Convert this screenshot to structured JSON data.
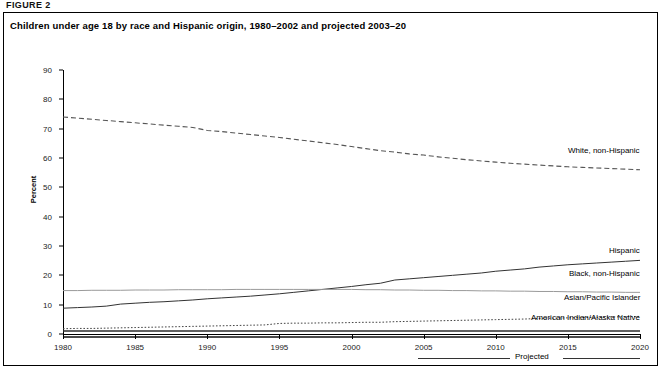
{
  "figure": {
    "label": "FIGURE 2",
    "title": "Children under age 18 by race and Hispanic origin, 1980–2002 and projected 2003–20",
    "projected_note": "Projected"
  },
  "chart_data": {
    "type": "line",
    "title": "Children under age 18 by race and Hispanic origin, 1980–2002 and projected 2003–20",
    "xlabel": "",
    "ylabel": "Percent",
    "xlim": [
      1980,
      2020
    ],
    "ylim": [
      0,
      90
    ],
    "ytick_labels": [
      "0",
      "10",
      "20",
      "30",
      "40",
      "50",
      "60",
      "70",
      "80",
      "90"
    ],
    "yticks": [
      0,
      10,
      20,
      30,
      40,
      50,
      60,
      70,
      80,
      90
    ],
    "xtick_labels": [
      "1980",
      "1985",
      "1990",
      "1995",
      "2000",
      "2005",
      "2010",
      "2015",
      "2020"
    ],
    "xticks": [
      1980,
      1985,
      1990,
      1995,
      2000,
      2005,
      2010,
      2015,
      2020
    ],
    "grid": false,
    "legend_position": "inline-right",
    "projected_start": 2003,
    "x": [
      1980,
      1981,
      1982,
      1983,
      1984,
      1985,
      1986,
      1987,
      1988,
      1989,
      1990,
      1991,
      1992,
      1993,
      1994,
      1995,
      1996,
      1997,
      1998,
      1999,
      2000,
      2001,
      2002,
      2003,
      2004,
      2005,
      2006,
      2007,
      2008,
      2009,
      2010,
      2011,
      2012,
      2013,
      2014,
      2015,
      2016,
      2017,
      2018,
      2019,
      2020
    ],
    "series": [
      {
        "name": "White, non-Hispanic",
        "style": "dashed",
        "color": "#555555",
        "label_x": 2010,
        "label_y": 62,
        "values": [
          74.0,
          73.6,
          73.2,
          72.8,
          72.4,
          72.0,
          71.6,
          71.2,
          70.8,
          70.4,
          69.4,
          69.0,
          68.5,
          68.0,
          67.5,
          67.0,
          66.4,
          65.8,
          65.2,
          64.6,
          63.9,
          63.2,
          62.5,
          62.0,
          61.4,
          61.0,
          60.4,
          59.9,
          59.4,
          59.0,
          58.6,
          58.2,
          57.9,
          57.6,
          57.3,
          57.0,
          56.8,
          56.6,
          56.4,
          56.2,
          56.0
        ]
      },
      {
        "name": "Hispanic",
        "style": "solid",
        "color": "#333333",
        "label_x": 2012,
        "label_y": 28,
        "values": [
          8.8,
          9.0,
          9.2,
          9.5,
          10.2,
          10.5,
          10.8,
          11.0,
          11.3,
          11.6,
          12.0,
          12.3,
          12.6,
          12.9,
          13.3,
          13.7,
          14.2,
          14.7,
          15.2,
          15.7,
          16.2,
          16.8,
          17.3,
          18.4,
          18.8,
          19.2,
          19.6,
          20.0,
          20.4,
          20.8,
          21.4,
          21.8,
          22.2,
          22.8,
          23.2,
          23.6,
          23.9,
          24.2,
          24.5,
          24.8,
          25.1
        ]
      },
      {
        "name": "Black, non-Hispanic",
        "style": "solid-light",
        "color": "#9a9a9a",
        "label_x": 2011,
        "label_y": 20,
        "values": [
          14.8,
          14.8,
          14.9,
          14.9,
          14.9,
          15.0,
          15.0,
          15.0,
          15.1,
          15.1,
          15.1,
          15.1,
          15.2,
          15.2,
          15.2,
          15.2,
          15.2,
          15.2,
          15.2,
          15.2,
          15.2,
          15.1,
          15.1,
          15.0,
          15.0,
          14.9,
          14.9,
          14.8,
          14.8,
          14.7,
          14.7,
          14.6,
          14.6,
          14.5,
          14.5,
          14.4,
          14.4,
          14.3,
          14.3,
          14.2,
          14.2
        ]
      },
      {
        "name": "Asian/Pacific Islander",
        "style": "dotted",
        "color": "#444444",
        "label_x": 2011,
        "label_y": 12,
        "values": [
          1.8,
          1.9,
          1.9,
          2.0,
          2.1,
          2.2,
          2.3,
          2.4,
          2.5,
          2.6,
          2.7,
          2.8,
          2.9,
          3.0,
          3.1,
          3.6,
          3.7,
          3.7,
          3.8,
          3.8,
          3.9,
          4.0,
          4.0,
          4.2,
          4.3,
          4.4,
          4.5,
          4.6,
          4.7,
          4.8,
          4.9,
          5.0,
          5.1,
          5.3,
          5.4,
          5.5,
          5.6,
          5.7,
          5.8,
          5.9,
          6.0
        ]
      },
      {
        "name": "American Indian/Alaska Native",
        "style": "solid-heavy",
        "color": "#2b2b2b",
        "label_x": 2010,
        "label_y": 5,
        "values": [
          1.0,
          1.0,
          1.0,
          1.0,
          1.0,
          1.0,
          1.0,
          1.0,
          1.0,
          1.0,
          1.0,
          1.0,
          1.0,
          1.0,
          1.0,
          1.0,
          1.0,
          1.0,
          1.0,
          1.0,
          1.0,
          1.0,
          1.0,
          1.0,
          1.0,
          1.0,
          1.0,
          1.0,
          1.0,
          1.0,
          1.0,
          1.0,
          1.0,
          1.0,
          1.0,
          1.0,
          1.0,
          1.0,
          1.0,
          1.0,
          1.0
        ]
      }
    ]
  }
}
